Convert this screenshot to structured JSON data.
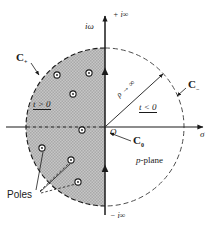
{
  "figure": {
    "name": "p-plane contour integration diagram",
    "plane_label": "p-plane",
    "plane_label_italic": "p",
    "plane_label_rest": "-plane"
  },
  "axes": {
    "imaginary_axis_label": "iω",
    "imaginary_top_label": "+ i∞",
    "imaginary_bottom_label": "− i∞",
    "real_axis_label": "σ"
  },
  "contours": [
    {
      "id": "c-plus",
      "label": "C",
      "subscript": "+",
      "description": "left semicircular contour"
    },
    {
      "id": "c-minus",
      "label": "C",
      "subscript": "−",
      "description": "right semicircular contour"
    },
    {
      "id": "c-zero",
      "label": "C",
      "subscript": "0",
      "description": "vertical Bromwich line"
    }
  ],
  "regions": {
    "left_label": "t > 0",
    "right_label": "t < 0"
  },
  "radius": {
    "label": "ρ → ∞",
    "symbol": "ρ",
    "arrow": "→∞"
  },
  "origin_label": "O",
  "poles_label": "Poles",
  "poles": [
    {
      "x": 57,
      "y": 75
    },
    {
      "x": 89,
      "y": 73
    },
    {
      "x": 73,
      "y": 94
    },
    {
      "x": 82,
      "y": 130
    },
    {
      "x": 42,
      "y": 148
    },
    {
      "x": 71,
      "y": 160
    },
    {
      "x": 78,
      "y": 182
    }
  ],
  "colors": {
    "ink": "#1a1a1a",
    "shade": "#b9b9b9",
    "paper": "#ffffff",
    "dashed": "#4d4d4d"
  },
  "geometry": {
    "origin_x": 105,
    "origin_y": 127,
    "circle_radius": 79
  }
}
